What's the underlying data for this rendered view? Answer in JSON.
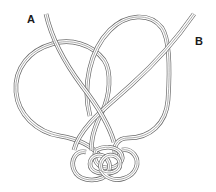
{
  "diagram": {
    "labels": {
      "a": "A",
      "b": "B"
    },
    "colors": {
      "cord_outline": "#6a6a6a",
      "cord_fill": "#ffffff",
      "label": "#1a1a1a",
      "background": "#ffffff"
    },
    "cords": [
      {
        "id": "A",
        "description": "Cord end A enters top-left, forms large left loop"
      },
      {
        "id": "B",
        "description": "Cord end B enters top-right, forms large right loop"
      }
    ],
    "knot": {
      "description": "Small woven decorative knot at bottom center"
    }
  }
}
